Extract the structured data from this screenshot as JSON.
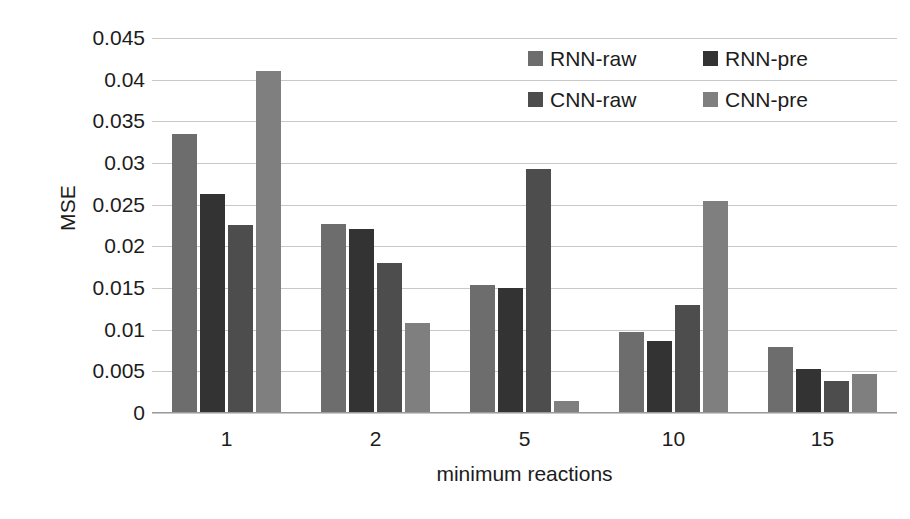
{
  "chart_data": {
    "type": "bar",
    "title": "",
    "xlabel": "minimum reactions",
    "ylabel": "MSE",
    "categories": [
      "1",
      "2",
      "5",
      "10",
      "15"
    ],
    "ylim": [
      0,
      0.045
    ],
    "yticks": [
      "0",
      "0.005",
      "0.01",
      "0.015",
      "0.02",
      "0.025",
      "0.03",
      "0.035",
      "0.04",
      "0.045"
    ],
    "ytick_values": [
      0,
      0.005,
      0.01,
      0.015,
      0.02,
      0.025,
      0.03,
      0.035,
      0.04,
      0.045
    ],
    "grid": true,
    "legend_position": "top-right",
    "series": [
      {
        "name": "RNN-raw",
        "color": "#6d6d6d",
        "values": [
          0.0335,
          0.0227,
          0.0154,
          0.0097,
          0.0079
        ]
      },
      {
        "name": "RNN-pre",
        "color": "#333333",
        "values": [
          0.0263,
          0.0221,
          0.015,
          0.0087,
          0.0053
        ]
      },
      {
        "name": "CNN-raw",
        "color": "#4d4d4d",
        "values": [
          0.0226,
          0.018,
          0.0293,
          0.013,
          0.0038
        ]
      },
      {
        "name": "CNN-pre",
        "color": "#7f7f7f",
        "values": [
          0.041,
          0.0108,
          0.0015,
          0.0255,
          0.0047
        ]
      }
    ]
  },
  "axes": {
    "y_title": "MSE",
    "x_title": "minimum reactions"
  }
}
